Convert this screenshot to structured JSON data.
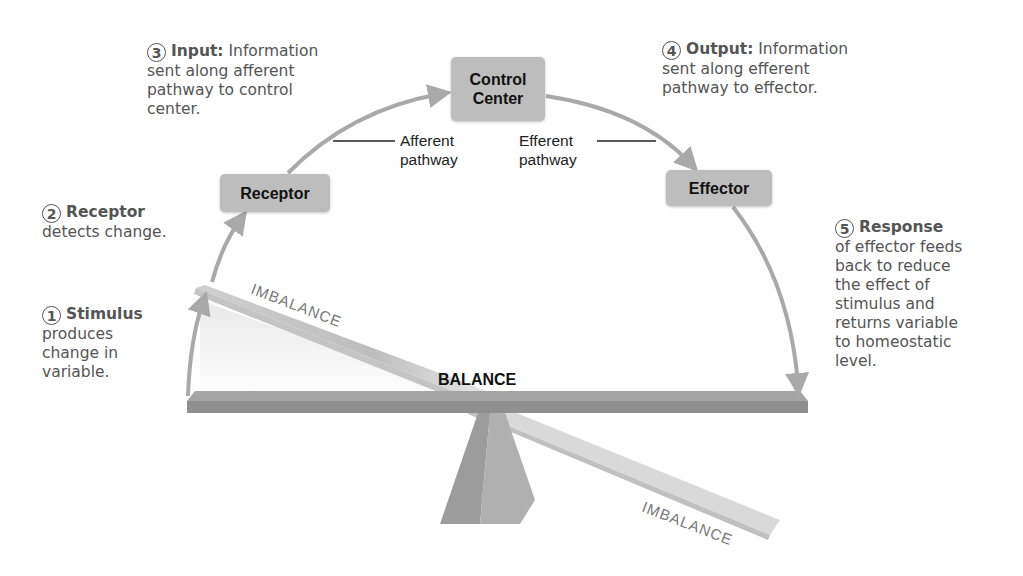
{
  "steps": [
    {
      "num": "1",
      "head": "Stimulus",
      "text": [
        "produces",
        "change in",
        "variable."
      ]
    },
    {
      "num": "2",
      "head": "Receptor",
      "text": [
        "detects change."
      ]
    },
    {
      "num": "3",
      "head": "Input:",
      "inline": "Information",
      "text": [
        "sent along afferent",
        "pathway to control",
        "center."
      ]
    },
    {
      "num": "4",
      "head": "Output:",
      "inline": "Information",
      "text": [
        "sent along efferent",
        "pathway to effector."
      ]
    },
    {
      "num": "5",
      "head": "Response",
      "text": [
        "of effector feeds",
        "back to reduce",
        "the effect of",
        "stimulus and",
        "returns variable",
        "to homeostatic",
        "level."
      ]
    }
  ],
  "boxes": {
    "receptor": "Receptor",
    "control_center_line1": "Control",
    "control_center_line2": "Center",
    "effector": "Effector"
  },
  "pathways": {
    "afferent_line1": "Afferent",
    "afferent_line2": "pathway",
    "efferent_line1": "Efferent",
    "efferent_line2": "pathway"
  },
  "seesaw": {
    "balance": "BALANCE",
    "imbalance_top": "IMBALANCE",
    "imbalance_bottom": "IMBALANCE"
  },
  "colors": {
    "arrow": "#a9a9a9",
    "box_fill": "#bdbdbd",
    "step_text": "#555555",
    "plank": "#9a9a9a"
  }
}
